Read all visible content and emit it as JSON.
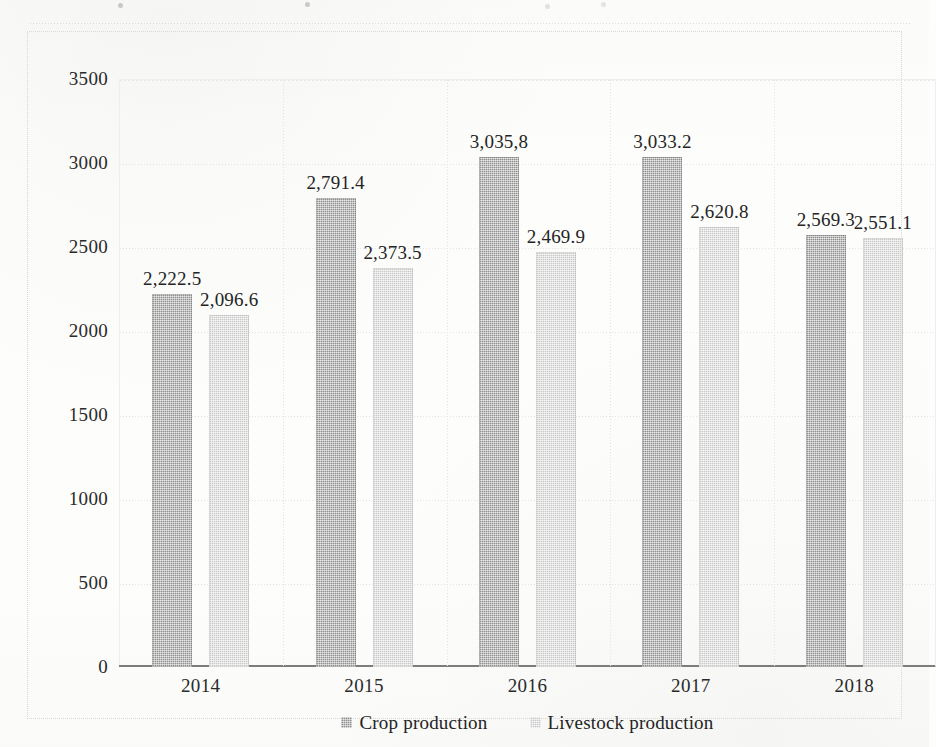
{
  "chart_data": {
    "type": "bar",
    "title": "",
    "subtitle": "",
    "xlabel": "",
    "ylabel": "",
    "categories": [
      "2014",
      "2015",
      "2016",
      "2017",
      "2018"
    ],
    "ylim": [
      0,
      3500
    ],
    "y_ticks": [
      3500,
      3000,
      2500,
      2000,
      1500,
      1000,
      500,
      0
    ],
    "y_tick_labels": [
      "3500",
      "3000",
      "2500",
      "2000",
      "1500",
      "1000",
      "500",
      "0"
    ],
    "grid": true,
    "grid_axis": "y",
    "legend_position": "bottom",
    "orientation": "vertical",
    "series": [
      {
        "name": "Crop production",
        "key": "crop",
        "color": "#8e8e8e",
        "values": [
          2222.5,
          2791.4,
          3035.8,
          3033.2,
          2569.3
        ],
        "data_labels": [
          "2,222.5",
          "2,791.4",
          "3,035,8",
          "3,033.2",
          "2,569.3"
        ]
      },
      {
        "name": "Livestock production",
        "key": "livestock",
        "color": "#c9c9c9",
        "values": [
          2096.6,
          2373.5,
          2469.9,
          2620.8,
          2551.1
        ],
        "data_labels": [
          "2,096.6",
          "2,373.5",
          "2,469.9",
          "2,620.8",
          "2,551.1"
        ]
      }
    ],
    "annotations": []
  },
  "legend": {
    "items": [
      {
        "label": "Crop production",
        "swatch": "legend-swatch-crop"
      },
      {
        "label": "Livestock production",
        "swatch": "legend-swatch-livestock"
      }
    ]
  }
}
